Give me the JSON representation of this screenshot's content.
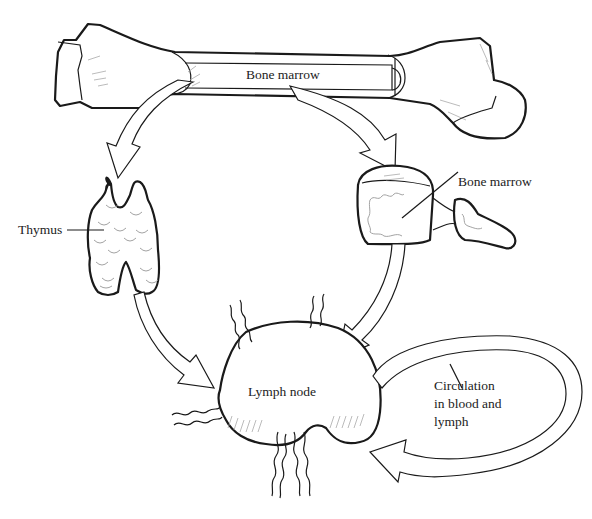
{
  "diagram": {
    "labels": {
      "bone_marrow_long_bone": "Bone marrow",
      "bone_marrow_vertebra": "Bone marrow",
      "thymus": "Thymus",
      "lymph_node": "Lymph node",
      "circulation_line1": "Circulation",
      "circulation_line2": "in blood and",
      "circulation_line3": "lymph"
    },
    "nodes": [
      {
        "id": "femur",
        "label": "Bone marrow"
      },
      {
        "id": "thymus",
        "label": "Thymus"
      },
      {
        "id": "vertebra",
        "label": "Bone marrow"
      },
      {
        "id": "lymph-node",
        "label": "Lymph node"
      },
      {
        "id": "circulation",
        "label": "Circulation in blood and lymph"
      }
    ],
    "edges": [
      {
        "from": "femur",
        "to": "thymus"
      },
      {
        "from": "femur",
        "to": "vertebra"
      },
      {
        "from": "thymus",
        "to": "lymph-node"
      },
      {
        "from": "vertebra",
        "to": "lymph-node"
      },
      {
        "from": "lymph-node",
        "to": "circulation"
      },
      {
        "from": "circulation",
        "to": "lymph-node"
      }
    ],
    "colors": {
      "stroke": "#1a1a1a",
      "background": "#ffffff",
      "text": "#222222"
    }
  }
}
